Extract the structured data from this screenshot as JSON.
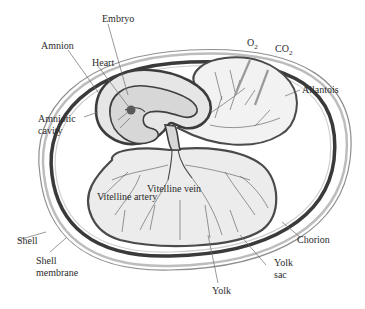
{
  "diagram": {
    "labels": {
      "embryo": "Embryo",
      "amnion": "Amnion",
      "heart": "Heart",
      "amniotic_cavity_line1": "Amniotic",
      "amniotic_cavity_line2": "cavity",
      "o2_main": "O",
      "o2_sub": "2",
      "co2_main": "CO",
      "co2_sub": "2",
      "allantois": "Allantois",
      "vitelline_vein": "Vitelline vein",
      "vitelline_artery": "Vitelline artery",
      "shell": "Shell",
      "shell_membrane_line1": "Shell",
      "shell_membrane_line2": "membrane",
      "chorion": "Chorion",
      "yolk_sac_line1": "Yolk",
      "yolk_sac_line2": "sac",
      "yolk": "Yolk"
    },
    "colors": {
      "outline_dark": "#3a3a3a",
      "fill_light": "#ececec",
      "label_text": "#2b2b2b"
    }
  }
}
